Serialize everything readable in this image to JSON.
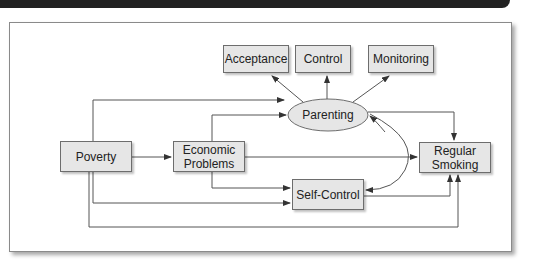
{
  "diagram": {
    "type": "path-model",
    "nodes": {
      "acceptance": "Acceptance",
      "control": "Control",
      "monitoring": "Monitoring",
      "parenting": "Parenting",
      "poverty": "Poverty",
      "economic_problems": "Economic Problems",
      "self_control": "Self-Control",
      "regular_smoking": "Regular Smoking"
    },
    "edges": [
      {
        "from": "Parenting",
        "to": "Acceptance"
      },
      {
        "from": "Parenting",
        "to": "Control"
      },
      {
        "from": "Parenting",
        "to": "Monitoring"
      },
      {
        "from": "Poverty",
        "to": "Parenting"
      },
      {
        "from": "Poverty",
        "to": "Economic Problems"
      },
      {
        "from": "Poverty",
        "to": "Self-Control"
      },
      {
        "from": "Poverty",
        "to": "Regular Smoking"
      },
      {
        "from": "Economic Problems",
        "to": "Parenting"
      },
      {
        "from": "Economic Problems",
        "to": "Regular Smoking"
      },
      {
        "from": "Economic Problems",
        "to": "Self-Control"
      },
      {
        "from": "Parenting",
        "to": "Regular Smoking"
      },
      {
        "from": "Self-Control",
        "to": "Regular Smoking"
      },
      {
        "from": "Parenting",
        "to": "Self-Control",
        "bidirectional": true
      }
    ]
  },
  "colors": {
    "box_fill": "#e6e6e6",
    "box_border": "#6d6d6d",
    "line": "#444444",
    "header_bar": "#222222"
  }
}
